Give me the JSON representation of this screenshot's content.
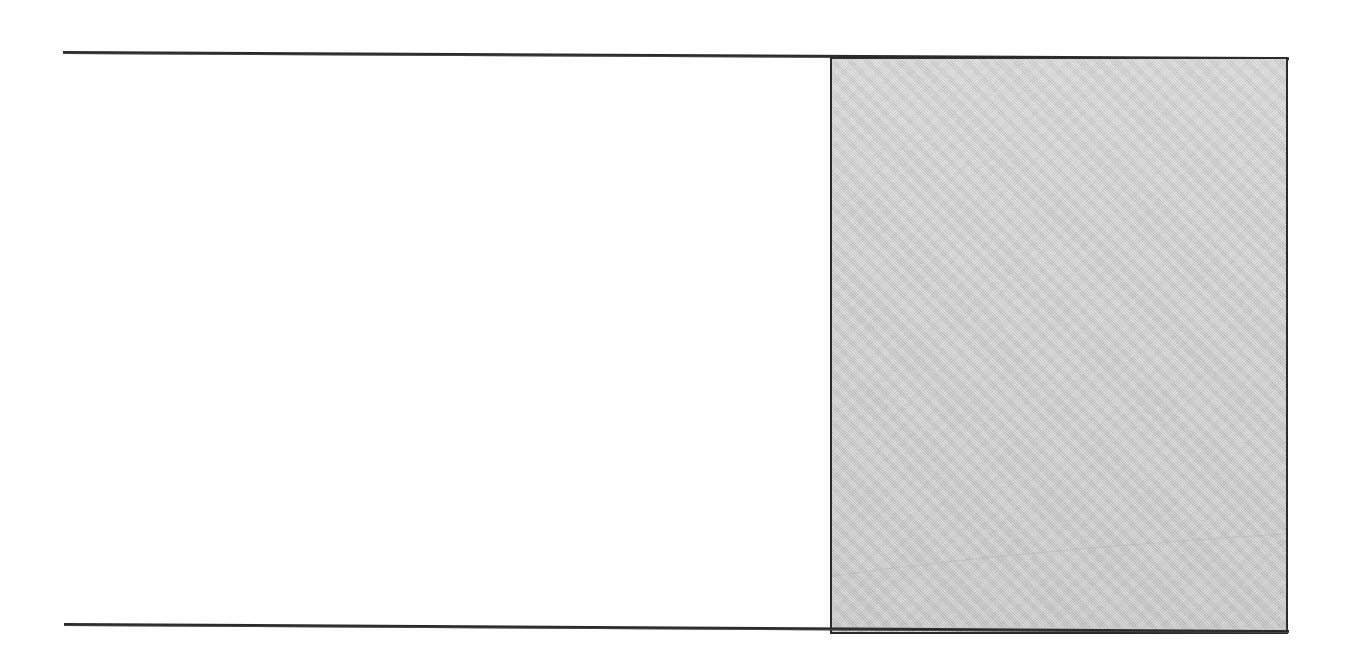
{
  "figure": {
    "kind": "scanned-page-figure",
    "caption": "",
    "has_text": false,
    "background_color": "#ffffff",
    "rule_color": "#2b2b2b",
    "block_fill_color": "#c9c9c9",
    "block_border_color": "#2b2b2b",
    "elements": [
      {
        "name": "top-rule",
        "type": "horizontal-line",
        "label": ""
      },
      {
        "name": "bottom-rule",
        "type": "horizontal-line",
        "label": ""
      },
      {
        "name": "gray-block",
        "type": "filled-rectangle",
        "label": ""
      }
    ]
  },
  "band": {
    "left_region_label": "",
    "right_region_label": ""
  }
}
